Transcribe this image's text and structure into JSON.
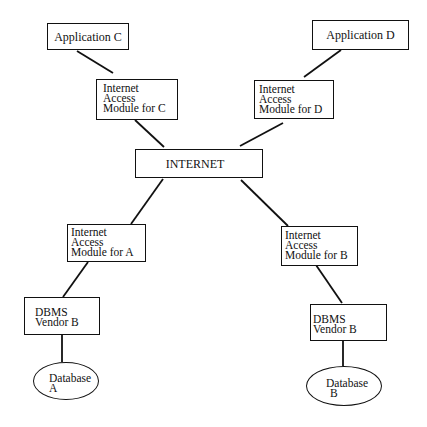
{
  "diagram": {
    "type": "network-architecture",
    "nodes": {
      "app_c": {
        "label": "Application C"
      },
      "app_d": {
        "label": "Application D"
      },
      "iam_c": {
        "line1": "Internet",
        "line2": "Access",
        "line3": "Module for C"
      },
      "iam_d": {
        "line1": "Internet",
        "line2": "Access",
        "line3": "Module for D"
      },
      "internet": {
        "label": "INTERNET"
      },
      "iam_a": {
        "line1": "Internet",
        "line2": "Access",
        "line3": "Module for A"
      },
      "iam_b": {
        "line1": "Internet",
        "line2": "Access",
        "line3": "Module for B"
      },
      "dbms_a": {
        "line1": "DBMS",
        "line2": "Vendor B"
      },
      "dbms_b": {
        "line1": "DBMS",
        "line2": "Vendor B"
      },
      "db_a": {
        "line1": "Database",
        "line2": "A"
      },
      "db_b": {
        "line1": "Database",
        "line2": "B"
      }
    },
    "edges": [
      [
        "app_c",
        "iam_c"
      ],
      [
        "app_d",
        "iam_d"
      ],
      [
        "iam_c",
        "internet"
      ],
      [
        "iam_d",
        "internet"
      ],
      [
        "internet",
        "iam_a"
      ],
      [
        "internet",
        "iam_b"
      ],
      [
        "iam_a",
        "dbms_a"
      ],
      [
        "iam_b",
        "dbms_b"
      ],
      [
        "dbms_a",
        "db_a"
      ],
      [
        "dbms_b",
        "db_b"
      ]
    ]
  }
}
